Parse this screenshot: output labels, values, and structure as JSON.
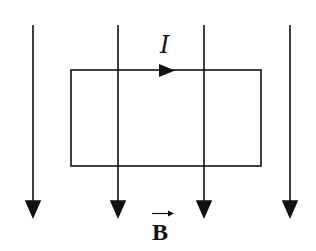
{
  "diagram": {
    "colors": {
      "stroke": "#111111",
      "background": "#ffffff"
    },
    "field_lines": [
      {
        "x": 33,
        "y1": 25,
        "y2": 204
      },
      {
        "x": 118,
        "y1": 25,
        "y2": 204
      },
      {
        "x": 204,
        "y1": 25,
        "y2": 204
      },
      {
        "x": 290,
        "y1": 25,
        "y2": 204
      }
    ],
    "loop": {
      "x": 71,
      "y": 70,
      "width": 190,
      "height": 96
    },
    "current_label": "I",
    "field_label": "B",
    "field_label_vector": true,
    "current_direction": "clockwise (rightward along top edge)",
    "field_direction": "down"
  }
}
